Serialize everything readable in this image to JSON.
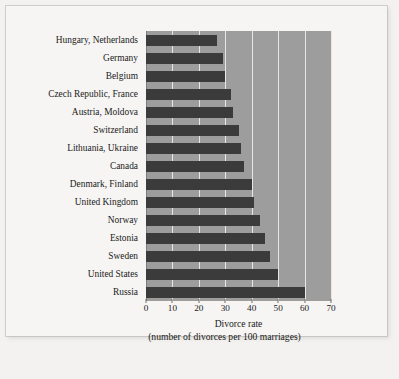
{
  "chart_data": {
    "type": "bar",
    "orientation": "horizontal",
    "title": "",
    "xlabel": "Divorce rate",
    "xlabel_line2": "(number of divorces per 100 marriages)",
    "ylabel": "",
    "xlim": [
      0,
      70
    ],
    "xticks": [
      0,
      10,
      20,
      30,
      40,
      50,
      60,
      70
    ],
    "grid": true,
    "grid_axis": "x",
    "legend": "none",
    "bar_color": "#3b3b3b",
    "plot_background": "#9d9d9d",
    "gridline_color": "#e8e7e4",
    "categories": [
      "Hungary, Netherlands",
      "Germany",
      "Belgium",
      "Czech Republic, France",
      "Austria, Moldova",
      "Switzerland",
      "Lithuania, Ukraine",
      "Canada",
      "Denmark, Finland",
      "United Kingdom",
      "Norway",
      "Estonia",
      "Sweden",
      "United States",
      "Russia"
    ],
    "values": [
      27,
      29,
      30,
      32,
      33,
      35,
      36,
      37,
      40,
      41,
      43,
      45,
      47,
      50,
      60
    ]
  },
  "figure": {
    "caption": ""
  }
}
